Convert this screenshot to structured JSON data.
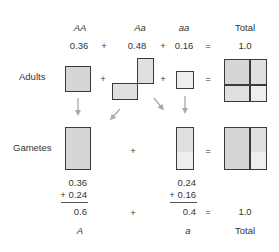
{
  "header": {
    "genotypes": [
      "AA",
      "Aa",
      "aa"
    ],
    "total_label": "Total",
    "frequencies": [
      "0.36",
      "0.48",
      "0.16"
    ],
    "total_value": "1.0",
    "plus": "+",
    "equals": "="
  },
  "rows": {
    "adults_label": "Adults",
    "gametes_label": "Gametes"
  },
  "sums": {
    "A_top": "0.36",
    "A_add": "+ 0.24",
    "A_result": "0.6",
    "a_top": "0.24",
    "a_add": "+ 0.16",
    "a_result": "0.4",
    "total_value": "1.0"
  },
  "footer": {
    "alleles": [
      "A",
      "a"
    ],
    "total_label": "Total"
  },
  "colors": {
    "border": "#3a3a3a",
    "fill_AA": "#d6d6d6",
    "fill_Aa": "#e0e0e0",
    "fill_aa": "#eeeeee",
    "arrow": "#a8a8a8"
  }
}
